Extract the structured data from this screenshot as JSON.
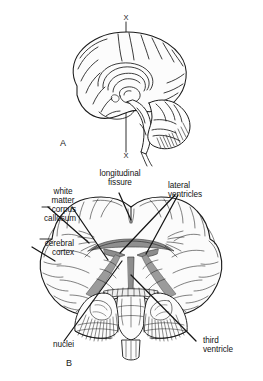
{
  "figure": {
    "background_color": "#ffffff",
    "ink_color": "#131313",
    "tissue_fill": "#fbfbfb",
    "ventricle_fill": "#9a9a9a",
    "panels": [
      {
        "id": "A",
        "letter": "A",
        "caption": "lateral view of brain with plane of section",
        "plane_markers": [
          "X",
          "X"
        ]
      },
      {
        "id": "B",
        "letter": "B",
        "caption": "coronal section of brain"
      }
    ]
  },
  "panel_a": {
    "letter": "A",
    "section_line_top_marker": "X",
    "section_line_bottom_marker": "X"
  },
  "panel_b": {
    "letter": "B",
    "labels": [
      {
        "id": "white-matter",
        "text": "white\nmatter",
        "align": "center",
        "x": 62,
        "y": 187
      },
      {
        "id": "longitudinal-fissure",
        "text": "longitudinal\nfissure",
        "align": "center",
        "x": 98,
        "y": 169
      },
      {
        "id": "lateral-ventricles",
        "text": "lateral\nventricles",
        "align": "left",
        "x": 169,
        "y": 181
      },
      {
        "id": "corpus-callosum",
        "text": "corpus\ncallosum",
        "align": "right",
        "x": 12,
        "y": 205
      },
      {
        "id": "cerebral-cortex",
        "text": "cerebral\ncortex",
        "align": "right",
        "x": 12,
        "y": 239
      },
      {
        "id": "nuclei",
        "text": "nuclei",
        "align": "right",
        "x": 44,
        "y": 341
      },
      {
        "id": "third-ventricle",
        "text": "third\nventricle",
        "align": "left",
        "x": 204,
        "y": 337
      }
    ]
  }
}
